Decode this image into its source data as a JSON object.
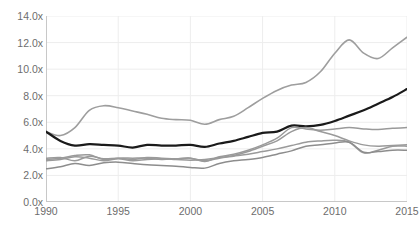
{
  "chart": {
    "title_fragment": "",
    "axis": {
      "ytick_labels": [
        "0.0x",
        "2.0x",
        "4.0x",
        "6.0x",
        "8.0x",
        "10.0x",
        "12.0x",
        "14.0x"
      ],
      "xtick_labels": [
        "1990",
        "1995",
        "2000",
        "2005",
        "2010",
        "2015"
      ]
    }
  },
  "chart_data": {
    "type": "line",
    "title": "",
    "xlabel": "",
    "ylabel": "",
    "xlim": [
      1990,
      2015
    ],
    "ylim": [
      0,
      14
    ],
    "ytick_values": [
      0,
      2,
      4,
      6,
      8,
      10,
      12,
      14
    ],
    "xtick_values": [
      1990,
      1995,
      2000,
      2005,
      2010,
      2015
    ],
    "ytick_format": "{v}x",
    "grid": true,
    "grid_color": "#ededed",
    "legend": "none",
    "background": "#ffffff",
    "x": [
      1990,
      1991,
      1992,
      1993,
      1994,
      1995,
      1996,
      1997,
      1998,
      1999,
      2000,
      2001,
      2002,
      2003,
      2004,
      2005,
      2006,
      2007,
      2008,
      2009,
      2010,
      2011,
      2012,
      2013,
      2014,
      2015
    ],
    "series": [
      {
        "name": "top-line",
        "color": "#9e9e9e",
        "width": 1.6,
        "emphasis": false,
        "values": [
          5.3,
          5.0,
          5.6,
          6.9,
          7.25,
          7.1,
          6.85,
          6.6,
          6.3,
          6.2,
          6.15,
          5.85,
          6.2,
          6.45,
          7.1,
          7.8,
          8.4,
          8.8,
          9.0,
          9.8,
          11.2,
          12.2,
          11.2,
          10.8,
          11.6,
          12.4
        ]
      },
      {
        "name": "highlight-line",
        "color": "#1a1a1a",
        "width": 2.2,
        "emphasis": true,
        "values": [
          5.3,
          4.6,
          4.25,
          4.35,
          4.3,
          4.25,
          4.1,
          4.3,
          4.25,
          4.25,
          4.3,
          4.15,
          4.4,
          4.6,
          4.9,
          5.2,
          5.3,
          5.75,
          5.7,
          5.8,
          6.1,
          6.5,
          6.9,
          7.4,
          7.9,
          8.5
        ]
      },
      {
        "name": "cluster-line-1",
        "color": "#9a9a9a",
        "width": 1.5,
        "emphasis": false,
        "values": [
          3.3,
          3.35,
          3.1,
          3.45,
          3.25,
          3.3,
          3.2,
          3.35,
          3.3,
          3.25,
          3.3,
          3.05,
          3.4,
          3.6,
          3.9,
          4.3,
          4.8,
          5.6,
          5.5,
          5.4,
          5.5,
          5.6,
          5.5,
          5.45,
          5.55,
          5.6
        ]
      },
      {
        "name": "cluster-line-2",
        "color": "#9a9a9a",
        "width": 1.5,
        "emphasis": false,
        "values": [
          3.1,
          3.2,
          3.4,
          3.3,
          3.1,
          3.25,
          3.1,
          3.2,
          3.25,
          3.2,
          3.15,
          3.2,
          3.35,
          3.5,
          3.8,
          4.2,
          4.6,
          5.3,
          5.6,
          5.3,
          5.0,
          4.6,
          4.3,
          4.2,
          4.25,
          4.3
        ]
      },
      {
        "name": "cluster-line-3",
        "color": "#9a9a9a",
        "width": 1.5,
        "emphasis": false,
        "values": [
          3.2,
          3.3,
          3.5,
          3.55,
          3.2,
          3.3,
          3.3,
          3.3,
          3.2,
          3.25,
          3.3,
          3.1,
          3.3,
          3.45,
          3.6,
          3.8,
          4.0,
          4.25,
          4.5,
          4.6,
          4.65,
          4.5,
          3.7,
          3.9,
          4.2,
          4.2
        ]
      },
      {
        "name": "cluster-line-4",
        "color": "#8d8d8d",
        "width": 1.5,
        "emphasis": false,
        "values": [
          2.5,
          2.65,
          2.9,
          2.75,
          2.95,
          3.0,
          2.9,
          2.8,
          2.75,
          2.7,
          2.6,
          2.55,
          2.9,
          3.1,
          3.2,
          3.35,
          3.6,
          3.85,
          4.2,
          4.3,
          4.45,
          4.5,
          3.75,
          3.8,
          3.9,
          3.9
        ]
      }
    ]
  }
}
